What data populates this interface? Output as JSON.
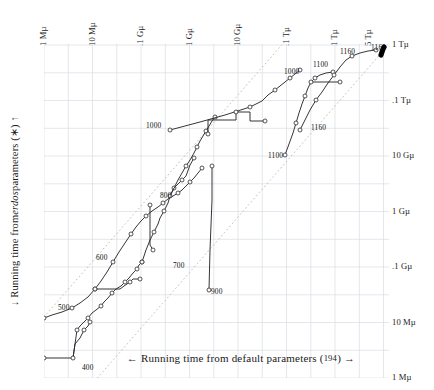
{
  "chart_data": {
    "type": "line",
    "title": "",
    "xlabel": "← Running time from default parameters (194) →",
    "ylabel": "↓ Running time from erdos parameters (∗) ↑",
    "xlabel_prefix": "← Running time from default parameters (",
    "xlabel_paren": "194",
    "xlabel_suffix": ") →",
    "ylabel_prefix": "↓ Running time from ",
    "ylabel_italic": "erdos",
    "ylabel_suffix": " parameters (∗) ↑",
    "x_axis_position": "top",
    "y_axis_position": "right",
    "x_scale": "log",
    "y_scale": "log",
    "grid": true,
    "xlim": [
      "1 Mµ",
      "5 Tµ"
    ],
    "ylim": [
      "1 Mµ",
      "1 Tµ"
    ],
    "xticks": [
      {
        "label": "1 Mµ",
        "value": 1000000.0
      },
      {
        "label": "10 Mµ",
        "value": 10000000.0
      },
      {
        "label": ".1 Gµ",
        "value": 100000000.0
      },
      {
        "label": "1 Gµ",
        "value": 1000000000.0
      },
      {
        "label": "10 Gµ",
        "value": 10000000000.0
      },
      {
        "label": ".1 Tµ",
        "value": 100000000000.0
      },
      {
        "label": "1 Tµ",
        "value": 1000000000000.0
      },
      {
        "label": "5 Tµ",
        "value": 5000000000000.0
      }
    ],
    "yticks": [
      {
        "label": "1 Tµ",
        "value": 1000000000000.0
      },
      {
        "label": ".1 Tµ",
        "value": 100000000000.0
      },
      {
        "label": "10 Gµ",
        "value": 10000000000.0
      },
      {
        "label": "1 Gµ",
        "value": 1000000000.0
      },
      {
        "label": ".1 Gµ",
        "value": 100000000.0
      },
      {
        "label": "10 Mµ",
        "value": 10000000.0
      },
      {
        "label": "1 Mµ",
        "value": 1000000.0
      }
    ],
    "reference_lines": [
      {
        "name": "upper-diagonal",
        "style": "dotted",
        "slope": 1,
        "offset_decades": 1.1
      },
      {
        "name": "lower-diagonal",
        "style": "dotted",
        "slope": 1,
        "offset_decades": -1.1
      }
    ],
    "point_labels": [
      {
        "text": "400",
        "x": 82,
        "y": 367
      },
      {
        "text": "500",
        "x": 58,
        "y": 307
      },
      {
        "text": "600",
        "x": 96,
        "y": 257
      },
      {
        "text": "700",
        "x": 173,
        "y": 265
      },
      {
        "text": "800",
        "x": 160,
        "y": 195
      },
      {
        "text": "900",
        "x": 211,
        "y": 291
      },
      {
        "text": "1000",
        "x": 146,
        "y": 125
      },
      {
        "text": "1000",
        "x": 284,
        "y": 71
      },
      {
        "text": "1100",
        "x": 313,
        "y": 64
      },
      {
        "text": "1100",
        "x": 268,
        "y": 155
      },
      {
        "text": "1160",
        "x": 311,
        "y": 127
      },
      {
        "text": "1160",
        "x": 340,
        "y": 51
      },
      {
        "text": "1161",
        "x": 371,
        "y": 47
      }
    ],
    "series": [
      {
        "name": "series-main-lower",
        "marker": "open-circle",
        "points": [
          [
            44,
            358
          ],
          [
            73,
            358
          ],
          [
            75,
            344
          ],
          [
            77,
            330
          ],
          [
            80,
            326
          ],
          [
            84,
            322
          ],
          [
            88,
            318
          ],
          [
            92,
            313
          ],
          [
            96,
            310
          ],
          [
            101,
            306
          ],
          [
            104,
            302
          ],
          [
            108,
            298
          ],
          [
            112,
            293
          ],
          [
            116,
            289
          ],
          [
            121,
            286
          ],
          [
            125,
            282
          ],
          [
            129,
            278
          ],
          [
            133,
            273
          ],
          [
            137,
            269
          ],
          [
            139,
            265
          ],
          [
            142,
            262
          ]
        ]
      },
      {
        "name": "series-400-branch",
        "marker": "open-circle",
        "points": [
          [
            73,
            358
          ],
          [
            75,
            344
          ],
          [
            80,
            338
          ],
          [
            84,
            330
          ],
          [
            88,
            326
          ],
          [
            90,
            322
          ]
        ]
      },
      {
        "name": "series-500-600",
        "marker": "open-circle",
        "points": [
          [
            44,
            318
          ],
          [
            52,
            315
          ],
          [
            62,
            312
          ],
          [
            72,
            308
          ],
          [
            80,
            303
          ],
          [
            88,
            297
          ],
          [
            95,
            289
          ],
          [
            101,
            281
          ],
          [
            107,
            272
          ],
          [
            113,
            262
          ],
          [
            119,
            252
          ],
          [
            125,
            243
          ],
          [
            131,
            234
          ],
          [
            136,
            227
          ],
          [
            141,
            221
          ],
          [
            146,
            216
          ],
          [
            152,
            211
          ],
          [
            158,
            207
          ],
          [
            163,
            203
          ],
          [
            168,
            199
          ],
          [
            173,
            196
          ],
          [
            178,
            193
          ],
          [
            182,
            190
          ],
          [
            186,
            186
          ],
          [
            190,
            182
          ],
          [
            194,
            178
          ],
          [
            198,
            173
          ],
          [
            202,
            168
          ]
        ]
      },
      {
        "name": "series-plateau-700",
        "marker": "open-circle",
        "points": [
          [
            95,
            289
          ],
          [
            120,
            289
          ],
          [
            124,
            286
          ],
          [
            130,
            282
          ],
          [
            133,
            279
          ],
          [
            140,
            279
          ]
        ]
      },
      {
        "name": "series-700-drop",
        "marker": "open-circle",
        "points": [
          [
            150,
            205
          ],
          [
            150,
            245
          ],
          [
            153,
            250
          ]
        ]
      },
      {
        "name": "series-800-up",
        "marker": "open-circle",
        "points": [
          [
            142,
            262
          ],
          [
            146,
            250
          ],
          [
            150,
            240
          ],
          [
            154,
            232
          ],
          [
            158,
            224
          ],
          [
            160,
            218
          ],
          [
            164,
            211
          ],
          [
            168,
            203
          ],
          [
            170,
            196
          ],
          [
            174,
            188
          ],
          [
            178,
            180
          ],
          [
            182,
            173
          ],
          [
            186,
            166
          ],
          [
            190,
            160
          ],
          [
            194,
            153
          ],
          [
            197,
            147
          ],
          [
            200,
            141
          ],
          [
            203,
            136
          ],
          [
            206,
            131
          ],
          [
            209,
            126
          ],
          [
            212,
            121
          ],
          [
            215,
            117
          ]
        ]
      },
      {
        "name": "series-800-sub",
        "marker": "open-circle",
        "points": [
          [
            170,
            196
          ],
          [
            174,
            188
          ],
          [
            178,
            184
          ],
          [
            182,
            180
          ],
          [
            186,
            176
          ],
          [
            190,
            165
          ],
          [
            194,
            158
          ]
        ]
      },
      {
        "name": "series-900-drop",
        "marker": "open-circle",
        "points": [
          [
            212,
            166
          ],
          [
            212,
            200
          ],
          [
            210,
            250
          ],
          [
            209,
            290
          ]
        ]
      },
      {
        "name": "series-1000-long",
        "marker": "open-circle",
        "points": [
          [
            170,
            130
          ],
          [
            200,
            122
          ],
          [
            225,
            115
          ],
          [
            250,
            107
          ],
          [
            262,
            101
          ],
          [
            268,
            95
          ],
          [
            275,
            90
          ],
          [
            280,
            86
          ],
          [
            285,
            82
          ],
          [
            290,
            78
          ],
          [
            295,
            74
          ],
          [
            300,
            70
          ]
        ]
      },
      {
        "name": "series-1000-step",
        "marker": "open-circle",
        "points": [
          [
            208,
            134
          ],
          [
            208,
            120
          ],
          [
            236,
            120
          ],
          [
            236,
            112
          ],
          [
            250,
            112
          ],
          [
            250,
            121
          ],
          [
            265,
            121
          ]
        ]
      },
      {
        "name": "series-1100-rise",
        "marker": "open-circle",
        "points": [
          [
            285,
            155
          ],
          [
            289,
            144
          ],
          [
            293,
            133
          ],
          [
            296,
            123
          ],
          [
            299,
            113
          ],
          [
            302,
            104
          ],
          [
            305,
            96
          ],
          [
            308,
            88
          ],
          [
            311,
            82
          ],
          [
            315,
            78
          ],
          [
            320,
            75
          ],
          [
            326,
            73
          ],
          [
            333,
            72
          ]
        ]
      },
      {
        "name": "series-1100-flat",
        "marker": "open-circle",
        "points": [
          [
            311,
            82
          ],
          [
            340,
            82
          ]
        ]
      },
      {
        "name": "series-1160-rise",
        "marker": "open-circle",
        "points": [
          [
            300,
            130
          ],
          [
            305,
            120
          ],
          [
            310,
            110
          ],
          [
            316,
            100
          ],
          [
            322,
            92
          ],
          [
            328,
            83
          ],
          [
            334,
            75
          ],
          [
            340,
            67
          ],
          [
            346,
            60
          ],
          [
            352,
            56
          ],
          [
            360,
            53
          ],
          [
            368,
            51
          ],
          [
            376,
            50
          ]
        ]
      },
      {
        "name": "series-1161-blob",
        "marker": "filled-blob",
        "points": [
          [
            381,
            55
          ],
          [
            382,
            52
          ],
          [
            383,
            49
          ],
          [
            384,
            47
          ]
        ]
      }
    ]
  },
  "axis": {
    "top_label_note": "x ticks are drawn rotated 90 degrees above the plot",
    "right_label_note": "y ticks are drawn to the right of the plot"
  }
}
